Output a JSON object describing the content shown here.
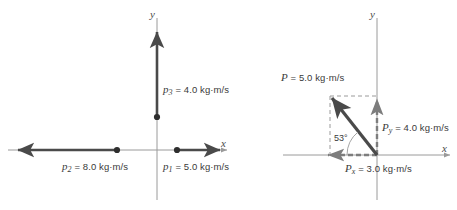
{
  "figure": {
    "background": "#ffffff",
    "axis_color": "#8a8a8a",
    "vector_color": "#4a4a4a",
    "dashed_color": "#9a9a9a",
    "text_color": "#3a3a3a"
  },
  "panel_left": {
    "name": "momentum-vectors-at-origin",
    "axis_x_label": "x",
    "axis_y_label": "y",
    "vectors": [
      {
        "id": "p1",
        "symbol": "p",
        "subscript": "1",
        "value": "5.0",
        "unit": "kg·m/s",
        "label": "p₁ = 5.0 kg·m/s",
        "direction": "+x",
        "magnitude": 5.0
      },
      {
        "id": "p2",
        "symbol": "p",
        "subscript": "2",
        "value": "8.0",
        "unit": "kg·m/s",
        "label": "p₂ = 8.0 kg·m/s",
        "direction": "-x",
        "magnitude": 8.0
      },
      {
        "id": "p3",
        "symbol": "p",
        "subscript": "3",
        "value": "4.0",
        "unit": "kg·m/s",
        "label": "p₃ = 4.0 kg·m/s",
        "direction": "+y",
        "magnitude": 4.0
      }
    ]
  },
  "panel_right": {
    "name": "resultant-momentum-components",
    "axis_x_label": "x",
    "axis_y_label": "y",
    "angle_label": "53°",
    "angle_value": 53,
    "vectors": [
      {
        "id": "P",
        "symbol": "P",
        "subscript": "",
        "value": "5.0",
        "unit": "kg·m/s",
        "label": "P = 5.0 kg·m/s",
        "direction": "up-left",
        "magnitude": 5.0
      },
      {
        "id": "Py",
        "symbol": "P",
        "subscript": "y",
        "value": "4.0",
        "unit": "kg·m/s",
        "label": "P_y = 4.0 kg·m/s",
        "direction": "+y",
        "magnitude": 4.0
      },
      {
        "id": "Px",
        "symbol": "P",
        "subscript": "x",
        "value": "3.0",
        "unit": "kg·m/s",
        "label": "P_x = 3.0 kg·m/s",
        "direction": "-x",
        "magnitude": 3.0
      }
    ]
  },
  "text": {
    "p1_eq": " = 5.0 kg·m/s",
    "p2_eq": " = 8.0 kg·m/s",
    "p3_eq": " = 4.0 kg·m/s",
    "P_eq": " = 5.0 kg·m/s",
    "Py_eq": " = 4.0 kg·m/s",
    "Px_eq": " = 3.0 kg·m/s",
    "p_sym": "p",
    "P_sym": "P",
    "sub1": "1",
    "sub2": "2",
    "sub3": "3",
    "subx": "x",
    "suby": "y",
    "angle": "53°",
    "axis_x": "x",
    "axis_y": "y"
  }
}
